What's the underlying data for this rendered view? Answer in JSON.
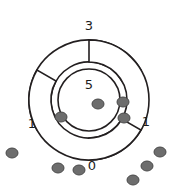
{
  "figure": {
    "top_cropped_text": "▪▪ ▪▪ ▪▪▪▪▪ ▪▪ ▪▪▪ ▪▪▪▪▪",
    "background_color": "#ffffff",
    "stroke_color": "#231f20",
    "dot_color": "#6d6d6d",
    "dot_stroke_color": "#4a4a4a",
    "labels": {
      "top_arc": "3",
      "center_circle": "5",
      "left_arc": "1",
      "right_arc": "1",
      "bottom": "0"
    },
    "geometry": {
      "center_x": 89,
      "center_y": 100,
      "center_circle_radius": 31,
      "arc_inner_radius": 38,
      "arc_outer_radius": 60,
      "arc_rotations_deg": [
        0,
        120,
        240
      ]
    },
    "dots": [
      {
        "cx": 98,
        "cy": 104,
        "rx": 6.0,
        "ry": 5.0,
        "group": "inner"
      },
      {
        "cx": 61,
        "cy": 117,
        "rx": 6.0,
        "ry": 5.0,
        "group": "inner"
      },
      {
        "cx": 123,
        "cy": 102,
        "rx": 6.0,
        "ry": 5.0,
        "group": "inner"
      },
      {
        "cx": 124,
        "cy": 118,
        "rx": 6.0,
        "ry": 5.0,
        "group": "inner"
      },
      {
        "cx": 12,
        "cy": 153,
        "rx": 6.0,
        "ry": 5.0,
        "group": "outer"
      },
      {
        "cx": 58,
        "cy": 168,
        "rx": 6.0,
        "ry": 5.0,
        "group": "outer"
      },
      {
        "cx": 79,
        "cy": 170,
        "rx": 6.0,
        "ry": 5.0,
        "group": "outer"
      },
      {
        "cx": 160,
        "cy": 152,
        "rx": 6.0,
        "ry": 5.0,
        "group": "outer"
      },
      {
        "cx": 147,
        "cy": 166,
        "rx": 6.0,
        "ry": 5.0,
        "group": "outer"
      },
      {
        "cx": 133,
        "cy": 180,
        "rx": 6.0,
        "ry": 5.0,
        "group": "outer"
      }
    ],
    "label_positions": {
      "top_arc": {
        "x": 89,
        "y": 26
      },
      "center_circle": {
        "x": 89,
        "y": 85
      },
      "left_arc": {
        "x": 32,
        "y": 124
      },
      "right_arc": {
        "x": 146,
        "y": 122
      },
      "bottom": {
        "x": 92,
        "y": 166
      }
    }
  }
}
